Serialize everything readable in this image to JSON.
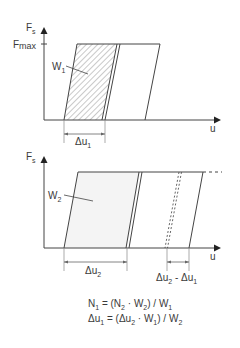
{
  "diagram": {
    "top_chart": {
      "y_axis_label": "F",
      "y_axis_sub": "s",
      "fmax_label": "F",
      "fmax_sub": "max",
      "x_axis_label": "u",
      "area_label": "W",
      "area_sub": "1",
      "dimension_label": "Δu",
      "dimension_sub": "1"
    },
    "bottom_chart": {
      "y_axis_label": "F",
      "y_axis_sub": "s",
      "x_axis_label": "u",
      "area_label": "W",
      "area_sub": "2",
      "dimension_label": "Δu",
      "dimension_sub": "2",
      "diff_label_a": "Δu",
      "diff_sub_a": "2",
      "diff_sep": " - Δu",
      "diff_sub_b": "1"
    },
    "formulas": {
      "line1": {
        "a": "N",
        "a_sub": "1",
        "b": " =  (N",
        "b_sub": "2",
        "c": " · W",
        "c_sub": "2",
        "d": ") / W",
        "d_sub": "1"
      },
      "line2": {
        "a": "Δu",
        "a_sub": "1",
        "b": " = (Δu",
        "b_sub": "2",
        "c": " · W",
        "c_sub": "1",
        "d": ") / W",
        "d_sub": "2"
      }
    }
  }
}
